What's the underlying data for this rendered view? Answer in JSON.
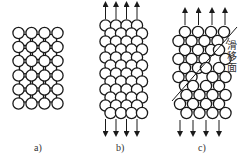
{
  "figure": {
    "stroke_color": "#1a1a1a",
    "circle_radius": 5.6,
    "panels": [
      {
        "id": "a",
        "label": "a)",
        "label_pos": [
          34,
          142
        ],
        "description": "Undeformed crystal lattice",
        "lattice": "square-centered",
        "main_rows_y": [
          33,
          47,
          61,
          75.5,
          89.5,
          103.5
        ],
        "main_cols_x": [
          18.5,
          31.5,
          44.5,
          57.5
        ],
        "arrows": null
      },
      {
        "id": "b",
        "label": "b)",
        "label_pos": [
          116,
          142
        ],
        "description": "Lattice under elastic tensile stress",
        "lattice": "hex",
        "rows_y": [
          25.5,
          33.5,
          41.5,
          49.5,
          57.5,
          65.5,
          73.5,
          81.5,
          89.5,
          97.5,
          105.5,
          113
        ],
        "even_cols_x": [
          105.5,
          116,
          126.5,
          137
        ],
        "odd_cols_x": [
          110.5,
          121,
          131.5
        ],
        "arrows": {
          "top_x": [
            105.5,
            116,
            126.5,
            137
          ],
          "top_y": [
            4,
            19
          ],
          "bottom_x": [
            105.5,
            116,
            126.5,
            137
          ],
          "bottom_y": [
            119,
            134
          ]
        }
      },
      {
        "id": "c",
        "label": "c)",
        "label_pos": [
          198,
          142
        ],
        "description": "Slip along the slip plane under tensile stress",
        "lattice": "slipped",
        "rows_y": [
          32,
          41,
          50,
          59,
          68,
          77,
          86,
          95,
          104,
          113
        ],
        "upper_cols_x": [
          185,
          198,
          211,
          224
        ],
        "lower_cols_x": [
          180,
          193,
          206,
          219
        ],
        "arrows": {
          "top_x": [
            185,
            198.5,
            212,
            225
          ],
          "top_y": [
            10,
            25
          ],
          "bottom_x": [
            180,
            193,
            206,
            219
          ],
          "bottom_y": [
            120,
            134
          ]
        },
        "slip_line": [
          [
            172,
            101
          ],
          [
            237,
            27
          ]
        ],
        "slip_plane_label": "滑移面",
        "slip_label_pos": [
          226,
          42
        ]
      }
    ]
  }
}
